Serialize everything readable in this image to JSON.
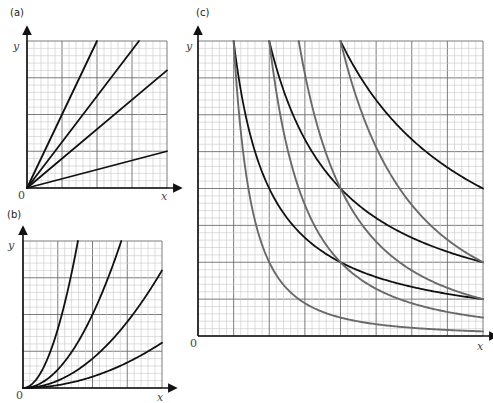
{
  "colors": {
    "grid_minor": "#c8c8c8",
    "grid_major": "#6e6e6e",
    "axis": "#111111",
    "curve_black": "#111111",
    "curve_gray": "#6a6a6a"
  },
  "chart_data": [
    {
      "id": "a",
      "panel_label": "(a)",
      "type": "line",
      "title": "(a)",
      "xlabel": "x",
      "ylabel": "y",
      "origin_label": "0",
      "xlim": [
        0,
        4
      ],
      "ylim": [
        0,
        4
      ],
      "grid": {
        "major_divisions": 4,
        "minor_per_major": 5
      },
      "series": [
        {
          "name": "line slope 2",
          "formula": "y = 2x",
          "color": "black",
          "points": [
            [
              0,
              0
            ],
            [
              2,
              4
            ]
          ]
        },
        {
          "name": "line slope 1.25",
          "formula": "y = 1.25x",
          "color": "black",
          "points": [
            [
              0,
              0
            ],
            [
              3.2,
              4
            ]
          ]
        },
        {
          "name": "line slope 0.8",
          "formula": "y = 0.8x",
          "color": "black",
          "points": [
            [
              0,
              0
            ],
            [
              4,
              3.2
            ]
          ]
        },
        {
          "name": "line slope 0.25",
          "formula": "y = 0.25x",
          "color": "black",
          "points": [
            [
              0,
              0
            ],
            [
              4,
              1
            ]
          ]
        }
      ]
    },
    {
      "id": "b",
      "panel_label": "(b)",
      "type": "line",
      "title": "(b)",
      "xlabel": "x",
      "ylabel": "y",
      "origin_label": "0",
      "xlim": [
        0,
        4
      ],
      "ylim": [
        0,
        4
      ],
      "grid": {
        "major_divisions": 4,
        "minor_per_major": 5
      },
      "series": [
        {
          "name": "parabola k=1.6",
          "formula": "y = 1.6x^2",
          "color": "black",
          "k": 1.6,
          "power": 2,
          "points": [
            [
              0,
              0
            ],
            [
              0.83,
              1.1
            ],
            [
              1.12,
              2.0
            ],
            [
              1.58,
              4.0
            ]
          ]
        },
        {
          "name": "parabola k=0.5",
          "formula": "y = 0.5x^2",
          "color": "black",
          "k": 0.5,
          "power": 2,
          "points": [
            [
              0,
              0
            ],
            [
              1,
              0.5
            ],
            [
              2,
              2
            ],
            [
              2.83,
              4
            ]
          ]
        },
        {
          "name": "parabola k=0.2",
          "formula": "y = 0.2x^2",
          "color": "black",
          "k": 0.2,
          "power": 2,
          "points": [
            [
              0,
              0
            ],
            [
              2,
              0.8
            ],
            [
              3.16,
              2
            ],
            [
              4,
              3.2
            ]
          ]
        },
        {
          "name": "parabola k=0.077",
          "formula": "y = 0.077x^2",
          "color": "black",
          "k": 0.077,
          "power": 2,
          "points": [
            [
              0,
              0
            ],
            [
              2,
              0.31
            ],
            [
              3.6,
              1
            ],
            [
              4,
              1.23
            ]
          ]
        }
      ]
    },
    {
      "id": "c",
      "panel_label": "(c)",
      "type": "line",
      "title": "(c)",
      "xlabel": "x",
      "ylabel": "y",
      "origin_label": "0",
      "xlim": [
        0,
        8
      ],
      "ylim": [
        0,
        8
      ],
      "grid": {
        "major_divisions": 8,
        "minor_per_major": 5
      },
      "series": [
        {
          "name": "hyperbola k=8",
          "formula": "y = 8/x",
          "color": "black",
          "k": 8,
          "power": 1,
          "x_start": 1,
          "points": [
            [
              1,
              8
            ],
            [
              2,
              4
            ],
            [
              4,
              2
            ],
            [
              8,
              1
            ]
          ]
        },
        {
          "name": "hyperbola k=16",
          "formula": "y = 16/x",
          "color": "black",
          "k": 16,
          "power": 1,
          "x_start": 2,
          "points": [
            [
              2,
              8
            ],
            [
              4,
              4
            ],
            [
              8,
              2
            ]
          ]
        },
        {
          "name": "hyperbola k=32",
          "formula": "y = 32/x",
          "color": "black",
          "k": 32,
          "power": 1,
          "x_start": 4,
          "points": [
            [
              4,
              8
            ],
            [
              8,
              4
            ]
          ]
        },
        {
          "name": "inverse square k=8",
          "formula": "y = 8/x^2",
          "color": "gray",
          "k": 8,
          "power": 2,
          "x_start": 1,
          "points": [
            [
              1,
              8
            ],
            [
              2,
              2
            ],
            [
              4,
              0.5
            ],
            [
              8,
              0.125
            ]
          ]
        },
        {
          "name": "inverse square k=32",
          "formula": "y = 32/x^2",
          "color": "gray",
          "k": 32,
          "power": 2,
          "x_start": 2,
          "points": [
            [
              2,
              8
            ],
            [
              4,
              2
            ],
            [
              8,
              0.5
            ]
          ]
        },
        {
          "name": "inverse square k=64",
          "formula": "y = 64/x^2",
          "color": "gray",
          "k": 64,
          "power": 2,
          "x_start": 2.83,
          "points": [
            [
              2.83,
              8
            ],
            [
              4,
              4
            ],
            [
              8,
              1
            ]
          ]
        },
        {
          "name": "inverse square k=128",
          "formula": "y = 128/x^2",
          "color": "gray",
          "k": 128,
          "power": 2,
          "x_start": 4,
          "points": [
            [
              4,
              8
            ],
            [
              8,
              2
            ]
          ]
        }
      ]
    }
  ]
}
